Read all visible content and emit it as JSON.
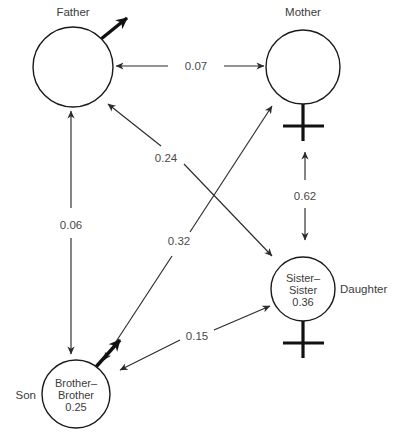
{
  "diagram": {
    "type": "path-diagram",
    "title": "",
    "background_color": "#ffffff",
    "stroke_color": "#1a1a1a",
    "text_color": "#3c3c3c",
    "nodes": [
      {
        "id": "father",
        "outer_label": "Father",
        "inner_lines": [],
        "sex_symbol": "male",
        "cx": 73,
        "cy": 67,
        "r": 40
      },
      {
        "id": "mother",
        "outer_label": "Mother",
        "inner_lines": [],
        "sex_symbol": "female",
        "cx": 303,
        "cy": 67,
        "r": 37
      },
      {
        "id": "daughter",
        "outer_label": "Daughter",
        "inner_lines": [
          "Sister–",
          "Sister",
          "0.36"
        ],
        "sex_symbol": "female",
        "cx": 303,
        "cy": 289,
        "r": 32
      },
      {
        "id": "son",
        "outer_label": "Son",
        "inner_lines": [
          "Brother–",
          "Brother",
          "0.25"
        ],
        "sex_symbol": "male",
        "cx": 76,
        "cy": 394,
        "r": 34
      }
    ],
    "edges": [
      {
        "id": "father-mother",
        "label": "0.07",
        "from": "father",
        "to": "mother",
        "arrows": "both",
        "label_x": 196,
        "label_y": 66
      },
      {
        "id": "father-son",
        "label": "0.06",
        "from": "father",
        "to": "son",
        "arrows": "both",
        "label_x": 71,
        "label_y": 225
      },
      {
        "id": "mother-daughter",
        "label": "0.62",
        "from": "mother",
        "to": "daughter",
        "arrows": "both",
        "label_x": 305,
        "label_y": 196
      },
      {
        "id": "father-daughter",
        "label": "0.24",
        "from": "father",
        "to": "daughter",
        "arrows": "both",
        "label_x": 166,
        "label_y": 158
      },
      {
        "id": "mother-son",
        "label": "0.32",
        "from": "mother",
        "to": "son",
        "arrows": "both",
        "label_x": 179,
        "label_y": 241
      },
      {
        "id": "son-daughter",
        "label": "0.15",
        "from": "son",
        "to": "daughter",
        "arrows": "both",
        "label_x": 197,
        "label_y": 344
      }
    ]
  }
}
